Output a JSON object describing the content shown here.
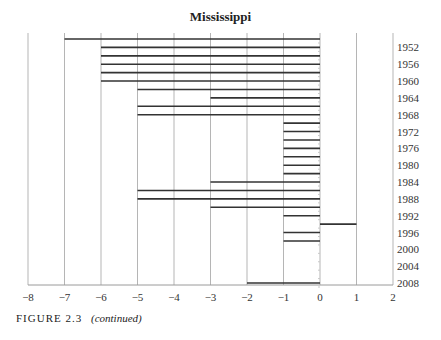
{
  "chart_data": {
    "type": "bar",
    "orientation": "horizontal",
    "title": "Mississippi",
    "xlabel": "",
    "ylabel": "",
    "xlim": [
      -8,
      2
    ],
    "x_ticks": [
      -8,
      -7,
      -6,
      -5,
      -4,
      -3,
      -2,
      -1,
      0,
      1,
      2
    ],
    "x_tick_labels": [
      "−8",
      "−7",
      "−6",
      "−5",
      "−4",
      "−3",
      "−2",
      "−1",
      "0",
      "1",
      "2"
    ],
    "y_tick_labels": [
      "1952",
      "1956",
      "1960",
      "1964",
      "1968",
      "1972",
      "1976",
      "1980",
      "1984",
      "1988",
      "1992",
      "1996",
      "2000",
      "2004",
      "2008"
    ],
    "grid": "vertical",
    "categories": [
      "1950",
      "1952",
      "1954",
      "1956",
      "1958",
      "1960",
      "1962",
      "1964",
      "1966",
      "1968",
      "1970",
      "1972",
      "1974",
      "1976",
      "1978",
      "1980",
      "1982",
      "1984",
      "1986",
      "1988",
      "1990",
      "1992",
      "1994",
      "1996",
      "1998",
      "2000",
      "2002",
      "2004",
      "2006",
      "2008"
    ],
    "values": [
      -7,
      -6,
      -6,
      -6,
      -6,
      -6,
      -5,
      -3,
      -5,
      -5,
      -1,
      -1,
      -1,
      -1,
      -1,
      -1,
      -1,
      -3,
      -5,
      -5,
      -3,
      -1,
      1,
      -1,
      -1,
      0,
      0,
      0,
      0,
      -2
    ]
  },
  "caption": {
    "label": "FIGURE 2.3",
    "note": "(continued)"
  }
}
